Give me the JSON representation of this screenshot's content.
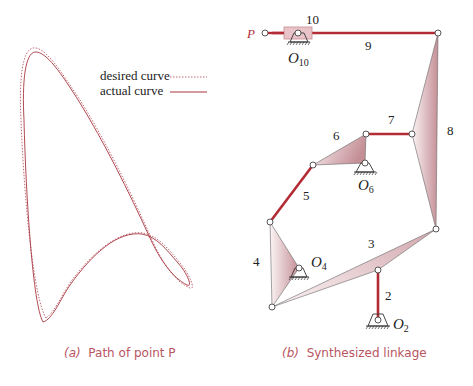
{
  "colors": {
    "accent": "#b32c35",
    "link_fill_light": "#f2e3e5",
    "link_fill_dark": "#c6949a",
    "outline": "#555555",
    "caption": "#b9555f"
  },
  "panel_a": {
    "caption_prefix": "(a)",
    "caption_text": "Path of point P",
    "legend": [
      {
        "label": "desired curve",
        "style": "dotted"
      },
      {
        "label": "actual curve",
        "style": "solid"
      }
    ]
  },
  "panel_b": {
    "caption_prefix": "(b)",
    "caption_text": "Synthesized linkage",
    "point_label": "P",
    "link_labels": {
      "l2": "2",
      "l3": "3",
      "l4": "4",
      "l5": "5",
      "l6": "6",
      "l7": "7",
      "l8": "8",
      "l9": "9",
      "l10": "10"
    },
    "pivot_labels": {
      "o2": {
        "base": "O",
        "sub": "2"
      },
      "o4": {
        "base": "O",
        "sub": "4"
      },
      "o6": {
        "base": "O",
        "sub": "6"
      },
      "o10": {
        "base": "O",
        "sub": "10"
      }
    }
  }
}
